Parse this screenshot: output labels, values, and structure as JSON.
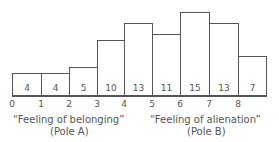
{
  "chart_data": {
    "type": "bar",
    "title": "",
    "categories": [
      "0",
      "1",
      "2",
      "3",
      "4",
      "5",
      "6",
      "7",
      "8"
    ],
    "values": [
      4,
      4,
      5,
      10,
      13,
      11,
      15,
      13,
      7
    ],
    "xlabel": "",
    "ylabel": "",
    "grid": false,
    "bar_value_labels": true,
    "annotations": [
      {
        "text": "“Feeling of belonging”",
        "sub": "(Pole A)",
        "position": "left, under 0-3"
      },
      {
        "text": "“Feeling of alienation”",
        "sub": "(Pole B)",
        "position": "right, under 5-8"
      }
    ]
  },
  "labels": {
    "pole_a": "“Feeling of belonging”",
    "pole_a_sub": "(Pole A)",
    "pole_b": "“Feeling of alienation”",
    "pole_b_sub": "(Pole B)"
  }
}
